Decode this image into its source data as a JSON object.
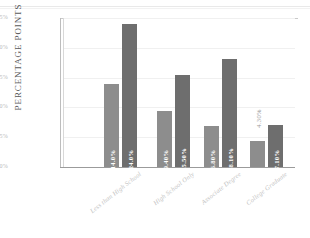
{
  "chart_data": {
    "type": "bar",
    "title": "",
    "subtitle": "",
    "xlabel": "",
    "ylabel": "PERCENTAGE POINTS",
    "ylim": [
      0,
      25
    ],
    "grid": true,
    "legend": "none",
    "orientation": "vertical",
    "grouping": "grouped",
    "categories": [
      "Less than High School",
      "High School Only",
      "Associate Degree",
      "College Graduate"
    ],
    "ytick_labels": [
      "25%",
      "20%",
      "15%",
      "10%",
      "5%",
      "0%"
    ],
    "ytick_values": [
      25,
      20,
      15,
      10,
      5,
      0
    ],
    "series": [
      {
        "name": "series-1",
        "color": "#8d8d8d",
        "values": [
          14.0,
          9.4,
          6.8,
          4.3
        ],
        "labels": [
          "14.0%",
          "9.40%",
          "6.80%",
          "4.30%"
        ],
        "label_placement": [
          "inside",
          "inside",
          "inside",
          "outside"
        ]
      },
      {
        "name": "series-2",
        "color": "#6e6e6e",
        "values": [
          24.0,
          15.5,
          18.1,
          7.1
        ],
        "labels": [
          "24.0%",
          "15.50%",
          "18.10%",
          "7.10%"
        ],
        "label_placement": [
          "inside",
          "inside",
          "inside",
          "inside"
        ]
      }
    ]
  },
  "axis": {
    "y_title": "PERCENTAGE POINTS"
  },
  "colors": {
    "series_1": "#8d8d8d",
    "series_2": "#6e6e6e",
    "axis": "#9b9b9b",
    "grid": "#f0f0f0",
    "tick_text": "#b9b9b9",
    "category_text": "#c2c2c2",
    "background": "#ffffff"
  }
}
